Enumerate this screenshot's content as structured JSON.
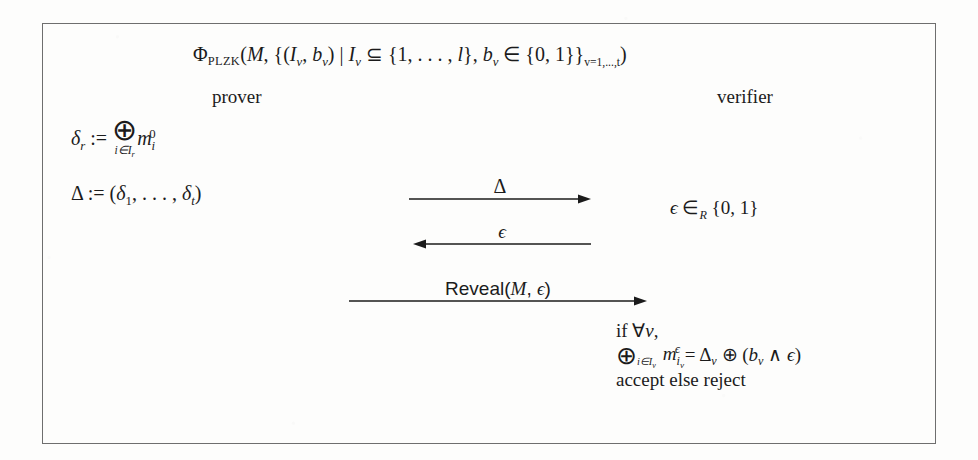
{
  "figure": {
    "title_formula": {
      "phi": "Φ",
      "phi_sub": "PLZK",
      "body_1": "(",
      "m": "M",
      "body_2": ", {(",
      "i_v_1": "I",
      "sub_v_1": "v",
      "comma_1": ", ",
      "b_v_1": "b",
      "sub_v_2": "v",
      "close_1": ") | ",
      "i_v_2": "I",
      "sub_v_3": "v",
      "subseteq": " ⊆ ",
      "set_l": "{1, . . . , ",
      "l": "l",
      "set_l_close": "}, ",
      "b_v_2": "b",
      "sub_v_4": "v",
      "in": " ∈ ",
      "binary_set": "{0, 1}}",
      "index_sub": "v=1,...,t",
      "close_2": ")"
    },
    "roles": {
      "prover": "prover",
      "verifier": "verifier"
    },
    "prover_steps": [
      {
        "id": "delta-r-definition",
        "lhs": "δ",
        "lhs_sub": "r",
        "assign": " := ",
        "operator": "⊕",
        "operator_limit": "i∈I",
        "operator_limit_sub": "r",
        "operand": "m",
        "operand_sub": "i",
        "operand_sup": "0"
      },
      {
        "id": "delta-tuple-definition",
        "lhs": "Δ",
        "assign": " := (",
        "first": "δ",
        "first_sub": "1",
        "ellipsis": ", . . . , ",
        "last": "δ",
        "last_sub": "t",
        "close": ")"
      }
    ],
    "verifier_random": {
      "epsilon": "ϵ",
      "in_r": " ∈",
      "in_r_sub": "R",
      "set": " {0, 1}"
    },
    "messages": [
      {
        "id": "message-delta",
        "label_math": "Δ",
        "label_plain": "Δ",
        "direction": "right"
      },
      {
        "id": "message-epsilon",
        "label_math": "ϵ",
        "label_plain": "ϵ",
        "direction": "left"
      },
      {
        "id": "message-reveal",
        "label_plain": "Reveal(M, ϵ)",
        "reveal_word": "Reveal(",
        "reveal_m": "M",
        "reveal_comma": ", ",
        "reveal_epsilon": "ϵ",
        "reveal_close": ")",
        "direction": "right"
      }
    ],
    "verifier_check": {
      "line1_if": "if ",
      "line1_forall": "∀",
      "line1_v": "v",
      "line1_comma": ",",
      "line2": {
        "operator": "⊕",
        "operator_limit": "i∈I",
        "operator_limit_sub": "v",
        "m": "m",
        "m_sub": "i",
        "m_sub_sub": "v",
        "m_sup": "ϵ",
        "equals": " = ",
        "delta": "Δ",
        "delta_sub": "v",
        "oplus": " ⊕ ",
        "open": "(",
        "b": "b",
        "b_sub": "v",
        "wedge": " ∧ ",
        "epsilon": "ϵ",
        "close": ")"
      },
      "line3": "accept else reject"
    },
    "colors": {
      "ink": "#1b1b1b",
      "border": "#6e6e6e",
      "paper": "#fdfdfc"
    }
  }
}
